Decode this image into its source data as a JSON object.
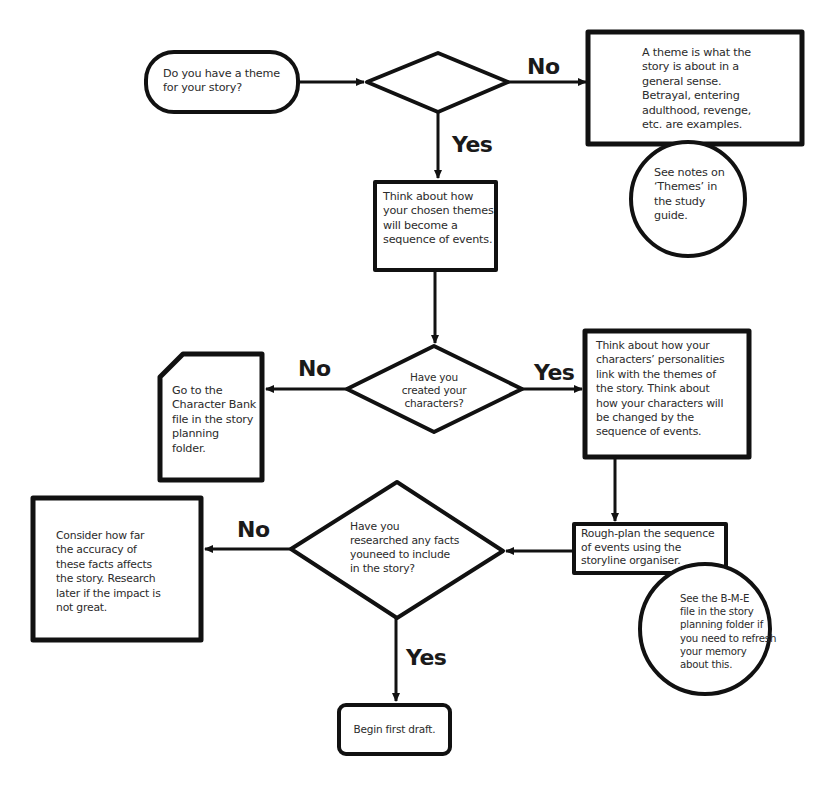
{
  "diagram": {
    "type": "flowchart",
    "nodes": {
      "start": {
        "shape": "terminator",
        "text": "Do you have a theme for your story?"
      },
      "decision_theme": {
        "shape": "decision",
        "text": ""
      },
      "theme_info": {
        "shape": "process",
        "text": "A theme is what the story is about in a general sense. Betrayal, entering adulthood, revenge, etc.  are examples."
      },
      "theme_note": {
        "shape": "circle",
        "text": "See notes on ‘Themes’ in the study guide."
      },
      "themes_to_events": {
        "shape": "process",
        "text": "Think about how your chosen themes will become a sequence of events."
      },
      "decision_characters": {
        "shape": "decision",
        "text": "Have you created your characters?"
      },
      "character_bank": {
        "shape": "document",
        "text": "Go to the Character Bank file in the story planning folder."
      },
      "characters_link": {
        "shape": "process",
        "text": "Think about how your characters’ personalities link with the themes  of the story.  Think about how your characters will be changed by the sequence of events."
      },
      "rough_plan": {
        "shape": "process",
        "text": "Rough-plan the sequence of events using  the storyline organiser."
      },
      "bme_note": {
        "shape": "circle",
        "text": "See the B-M-E file in the story planning folder if you need to refresh your memory about this."
      },
      "decision_research": {
        "shape": "decision",
        "text": "Have you researched any facts youneed to include in the story?"
      },
      "consider_accuracy": {
        "shape": "process",
        "text": "Consider how far the accuracy of these facts affects the story. Research later if the impact is not great."
      },
      "begin_draft": {
        "shape": "terminator",
        "text": "Begin first draft."
      }
    },
    "edge_labels": {
      "theme_no": "No",
      "theme_yes": "Yes",
      "characters_no": "No",
      "characters_yes": "Yes",
      "research_no": "No",
      "research_yes": "Yes"
    },
    "lines": {
      "theme_info": [
        "A theme is what the",
        "story is about in a",
        "general sense.",
        "Betrayal, entering",
        "adulthood, revenge,",
        "etc.  are examples."
      ],
      "theme_note": [
        "See notes on",
        "‘Themes’ in",
        "the study",
        "guide."
      ],
      "themes_to_events": [
        "Think about how",
        "your chosen themes",
        "will become a",
        "sequence of events."
      ],
      "decision_characters": [
        "Have you",
        "created your",
        "characters?"
      ],
      "character_bank": [
        "Go to the",
        "Character Bank",
        "file in the story",
        "planning",
        "folder."
      ],
      "characters_link": [
        "Think about how your",
        "characters’ personalities",
        "link with the themes  of",
        "the story.  Think about",
        "how your characters will",
        "be changed by the",
        "sequence of events."
      ],
      "rough_plan": [
        "Rough-plan the sequence",
        "of events using  the",
        "storyline organiser."
      ],
      "bme_note": [
        "See the B-M-E",
        "file in the story",
        "planning folder if",
        "you need to refresh",
        "your memory",
        "about this."
      ],
      "decision_research": [
        "Have you",
        "researched any facts",
        "youneed to include",
        "in the story?"
      ],
      "consider_accuracy": [
        "Consider how far",
        "the accuracy of",
        "these facts affects",
        "the story. Research",
        "later if the impact is",
        "not great."
      ],
      "start": [
        "Do you have a theme",
        "for your story?"
      ]
    },
    "colors": {
      "stroke": "#111111",
      "text": "#2b2b2b",
      "background": "#ffffff"
    }
  }
}
